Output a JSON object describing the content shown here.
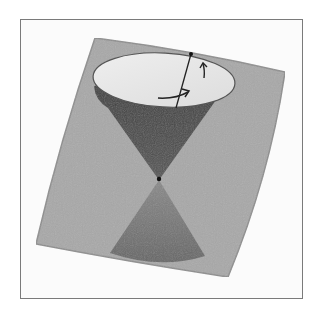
{
  "figure": {
    "colors": {
      "background": "#ffffff",
      "frame_border": "#7a7a7a",
      "plane": "#a9a9a9",
      "plane_edge": "#8e8e8e",
      "upper_cone": "#4a4a4a",
      "upper_cone_top_ellipse": "#e6e6e6",
      "lower_cone": "#707070",
      "ink": "#222222"
    },
    "elements": {
      "plane": "tilted-square-plane",
      "upper_cone": "future-light-cone",
      "lower_cone": "past-light-cone",
      "apex": "event-point",
      "axis": "vertical-axis-line",
      "arrows": [
        "rotation-arrow-horizontal",
        "rotation-arrow-up"
      ]
    }
  }
}
